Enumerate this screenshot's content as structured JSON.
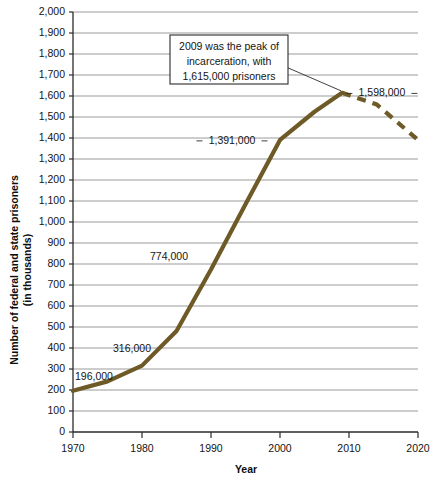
{
  "chart_data": {
    "type": "line",
    "title": "",
    "xlabel": "Year",
    "ylabel": "Number of federal and state prisoners\n(in thousands)",
    "ylabel_line1": "Number of federal and state prisoners",
    "ylabel_line2": "(in thousands)",
    "xlim": [
      1970,
      2020
    ],
    "ylim": [
      0,
      2000
    ],
    "grid": "horizontal",
    "legend": "none",
    "y_ticks": [
      "0",
      "100",
      "200",
      "300",
      "400",
      "500",
      "600",
      "700",
      "800",
      "900",
      "1,000",
      "1,100",
      "1,200",
      "1,300",
      "1,400",
      "1,500",
      "1,600",
      "1,700",
      "1,800",
      "1,900",
      "2,000"
    ],
    "y_tick_values": [
      0,
      100,
      200,
      300,
      400,
      500,
      600,
      700,
      800,
      900,
      1000,
      1100,
      1200,
      1300,
      1400,
      1500,
      1600,
      1700,
      1800,
      1900,
      2000
    ],
    "x_ticks": [
      "1970",
      "1980",
      "1990",
      "2000",
      "2010",
      "2020"
    ],
    "x_tick_values": [
      1970,
      1980,
      1990,
      2000,
      2010,
      2020
    ],
    "series": [
      {
        "name": "Federal and state prisoners",
        "color": "#6d5a26",
        "style": "solid",
        "x": [
          1970,
          1975,
          1980,
          1985,
          1990,
          1995,
          2000,
          2005,
          2009
        ],
        "values": [
          196,
          241,
          316,
          481,
          774,
          1085,
          1391,
          1525,
          1615
        ]
      },
      {
        "name": "Federal and state prisoners (projected)",
        "color": "#6d5a26",
        "style": "dashed",
        "x": [
          2009,
          2014,
          2020
        ],
        "values": [
          1615,
          1560,
          1391
        ]
      }
    ],
    "point_labels": [
      {
        "text": "196,000",
        "x": 1970,
        "value": 196
      },
      {
        "text": "316,000",
        "x": 1980,
        "value": 316
      },
      {
        "text": "774,000",
        "x": 1990,
        "value": 774
      },
      {
        "text": "1,391,000",
        "x": 2000,
        "value": 1391
      },
      {
        "text": "1,598,000",
        "x": 2011,
        "value": 1598
      }
    ],
    "annotations": [
      {
        "id": "peak-callout",
        "lines": [
          "2009 was the peak of",
          "incarceration, with",
          "1,615,000 prisoners"
        ],
        "points_to_x": 2009,
        "points_to_value": 1615
      }
    ]
  },
  "colors": {
    "series": "#6d5a26",
    "gridline": "#9a9a9a",
    "axis": "#2b2b2b",
    "background": "#ffffff"
  }
}
